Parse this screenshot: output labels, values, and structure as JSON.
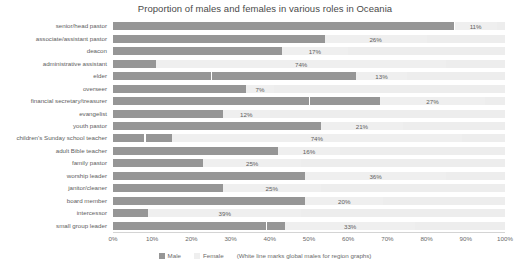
{
  "chart_data": {
    "type": "bar",
    "subtype": "stacked-horizontal-100pct",
    "title": "Proportion of males and females in various roles in Oceania",
    "xlabel": "",
    "ylabel": "",
    "xlim": [
      0,
      100
    ],
    "xunit": "%",
    "grid": false,
    "legend_position": "bottom",
    "categories": [
      "senior/head pastor",
      "associate/assistant pastor",
      "deacon",
      "administrative assistant",
      "elder",
      "overseer",
      "financial secretary/treasurer",
      "evangelist",
      "youth pastor",
      "children's Sunday school teacher",
      "adult Bible teacher",
      "family pastor",
      "worship leader",
      "janitor/cleaner",
      "board member",
      "intercessor",
      "small group leader"
    ],
    "series": [
      {
        "name": "Male",
        "color": "#969696",
        "values": [
          87,
          54,
          43,
          11,
          62,
          34,
          68,
          28,
          53,
          15,
          42,
          23,
          49,
          28,
          49,
          9,
          44
        ]
      },
      {
        "name": "Female",
        "color": "#efefef",
        "values": [
          11,
          26,
          17,
          74,
          13,
          7,
          27,
          12,
          21,
          74,
          16,
          25,
          36,
          25,
          20,
          39,
          33
        ]
      }
    ],
    "value_labels": [
      "11%",
      "26%",
      "17%",
      "74%",
      "13%",
      "7%",
      "27%",
      "12%",
      "21%",
      "74%",
      "16%",
      "25%",
      "36%",
      "25%",
      "20%",
      "39%",
      "33%"
    ],
    "global_male_markers": [
      87,
      null,
      null,
      null,
      25,
      null,
      50,
      null,
      null,
      8,
      null,
      null,
      null,
      null,
      null,
      null,
      39
    ],
    "tick_labels": [
      "0%",
      "10%",
      "20%",
      "30%",
      "40%",
      "50%",
      "60%",
      "70%",
      "80%",
      "90%",
      "100%"
    ],
    "tick_values": [
      0,
      10,
      20,
      30,
      40,
      50,
      60,
      70,
      80,
      90,
      100
    ],
    "annotations": [
      "(White line marks global males for region graphs)"
    ]
  },
  "legend": {
    "male_label": "Male",
    "female_label": "Female",
    "note": "(White line marks global males for region graphs)"
  }
}
